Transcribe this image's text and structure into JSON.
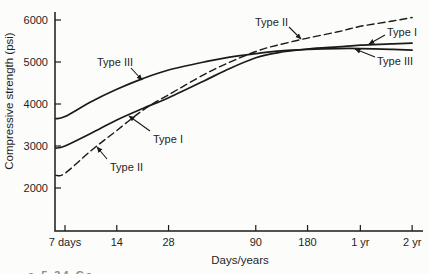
{
  "figure": {
    "caption_fragment": "e 5.34   Co"
  },
  "chart_data": {
    "type": "line",
    "title": "",
    "xlabel": "Days/years",
    "ylabel": "Compressive strength (psi)",
    "x_scale": "log",
    "grid": false,
    "legend_position": "inline-annotations",
    "x_ticks": [
      {
        "label": "7 days",
        "days": 7
      },
      {
        "label": "14",
        "days": 14
      },
      {
        "label": "28",
        "days": 28
      },
      {
        "label": "90",
        "days": 90
      },
      {
        "label": "180",
        "days": 180
      },
      {
        "label": "1 yr",
        "days": 365
      },
      {
        "label": "2 yr",
        "days": 730
      }
    ],
    "y_ticks": [
      2000,
      3000,
      4000,
      5000,
      6000
    ],
    "ylim": [
      1000,
      6200
    ],
    "xlim_days": [
      6.2,
      730
    ],
    "series": [
      {
        "name": "Type I",
        "line": "solid",
        "color": "#1a1a1a",
        "points": [
          [
            6.2,
            2950
          ],
          [
            7,
            3000
          ],
          [
            10,
            3310
          ],
          [
            14,
            3620
          ],
          [
            20,
            3900
          ],
          [
            28,
            4150
          ],
          [
            45,
            4550
          ],
          [
            60,
            4800
          ],
          [
            90,
            5100
          ],
          [
            120,
            5220
          ],
          [
            180,
            5310
          ],
          [
            270,
            5360
          ],
          [
            365,
            5400
          ],
          [
            550,
            5430
          ],
          [
            730,
            5450
          ]
        ]
      },
      {
        "name": "Type II",
        "line": "dashed",
        "color": "#1a1a1a",
        "points": [
          [
            6.2,
            2300
          ],
          [
            7,
            2350
          ],
          [
            10,
            2900
          ],
          [
            14,
            3370
          ],
          [
            20,
            3860
          ],
          [
            28,
            4220
          ],
          [
            45,
            4700
          ],
          [
            60,
            4950
          ],
          [
            90,
            5250
          ],
          [
            120,
            5400
          ],
          [
            180,
            5570
          ],
          [
            270,
            5720
          ],
          [
            365,
            5850
          ],
          [
            550,
            5970
          ],
          [
            730,
            6060
          ]
        ]
      },
      {
        "name": "Type III",
        "line": "solid",
        "color": "#1a1a1a",
        "points": [
          [
            6.2,
            3650
          ],
          [
            7,
            3700
          ],
          [
            10,
            4060
          ],
          [
            14,
            4350
          ],
          [
            20,
            4610
          ],
          [
            28,
            4810
          ],
          [
            45,
            5000
          ],
          [
            60,
            5100
          ],
          [
            90,
            5200
          ],
          [
            120,
            5260
          ],
          [
            180,
            5300
          ],
          [
            270,
            5320
          ],
          [
            365,
            5320
          ],
          [
            550,
            5300
          ],
          [
            730,
            5280
          ]
        ]
      }
    ],
    "annotations": [
      {
        "text": "Type III",
        "tx": 97,
        "ty": 66,
        "x1": 131,
        "y1": 68,
        "x2": 142,
        "y2": 80
      },
      {
        "text": "Type I",
        "tx": 153,
        "ty": 143,
        "x1": 150,
        "y1": 131,
        "x2": 129,
        "y2": 116
      },
      {
        "text": "Type II",
        "tx": 110,
        "ty": 171,
        "x1": 107,
        "y1": 159,
        "x2": 97,
        "y2": 147
      },
      {
        "text": "Type II",
        "tx": 255,
        "ty": 26,
        "x1": 289,
        "y1": 27,
        "x2": 301,
        "y2": 39
      },
      {
        "text": "Type I",
        "tx": 387,
        "ty": 36,
        "x1": 385,
        "y1": 35,
        "x2": 369,
        "y2": 44
      },
      {
        "text": "Type III",
        "tx": 377,
        "ty": 65,
        "x1": 375,
        "y1": 57,
        "x2": 355,
        "y2": 49
      }
    ]
  }
}
